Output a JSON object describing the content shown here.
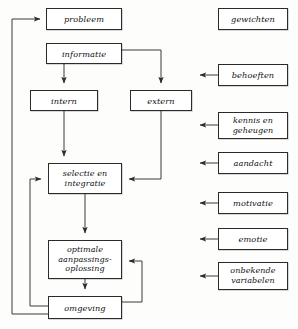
{
  "diagram": {
    "language": "nl",
    "style": {
      "box_border_color": "#2b2b2b",
      "box_fill_color": "#ffffff",
      "line_color": "#3a3a3a",
      "text_color": "#111111",
      "background_color": "#fdfdfc"
    },
    "main_flow": [
      {
        "id": "probleem",
        "label": "probleem",
        "x": 46,
        "y": 8,
        "w": 76,
        "h": 22
      },
      {
        "id": "informatie",
        "label": "informatie",
        "x": 46,
        "y": 43,
        "w": 76,
        "h": 21
      },
      {
        "id": "intern",
        "label": "intern",
        "x": 30,
        "y": 90,
        "w": 68,
        "h": 21
      },
      {
        "id": "extern",
        "label": "extern",
        "x": 130,
        "y": 90,
        "w": 62,
        "h": 21
      },
      {
        "id": "selectie",
        "label_line1": "selectie en",
        "label_line2": "integratie",
        "x": 48,
        "y": 163,
        "w": 74,
        "h": 31
      },
      {
        "id": "oplossing",
        "label_line1": "optimale",
        "label_line2": "aanpassings-",
        "label_line3": "oplossing",
        "x": 48,
        "y": 240,
        "w": 74,
        "h": 39
      },
      {
        "id": "omgeving",
        "label": "omgeving",
        "x": 48,
        "y": 296,
        "w": 74,
        "h": 23
      }
    ],
    "side_factors": [
      {
        "id": "gewichten",
        "label": "gewichten",
        "x": 218,
        "y": 8,
        "w": 70,
        "h": 22,
        "has_arrow": false
      },
      {
        "id": "behoeften",
        "label": "behoeften",
        "x": 218,
        "y": 64,
        "w": 70,
        "h": 22,
        "has_arrow": true
      },
      {
        "id": "kennis-en-geheugen",
        "label_line1": "kennis en",
        "label_line2": "geheugen",
        "x": 218,
        "y": 112,
        "w": 70,
        "h": 27,
        "has_arrow": true
      },
      {
        "id": "aandacht",
        "label": "aandacht",
        "x": 218,
        "y": 152,
        "w": 70,
        "h": 22,
        "has_arrow": true
      },
      {
        "id": "motivatie",
        "label": "motivatie",
        "x": 218,
        "y": 192,
        "w": 70,
        "h": 22,
        "has_arrow": true
      },
      {
        "id": "emotie",
        "label": "emotie",
        "x": 218,
        "y": 228,
        "w": 70,
        "h": 22,
        "has_arrow": true
      },
      {
        "id": "onbekende-variabelen",
        "label_line1": "onbekende",
        "label_line2": "variabelen",
        "x": 218,
        "y": 262,
        "w": 70,
        "h": 28,
        "has_arrow": true
      }
    ],
    "connections": [
      {
        "from": "feedback-outer",
        "to": "probleem",
        "type": "feedback-loop-left-outer"
      },
      {
        "from": "probleem",
        "to": "informatie",
        "type": "adjacent"
      },
      {
        "from": "informatie",
        "to": "intern",
        "type": "down"
      },
      {
        "from": "informatie",
        "to": "extern",
        "type": "right-then-down"
      },
      {
        "from": "intern",
        "to": "selectie",
        "type": "down"
      },
      {
        "from": "extern",
        "to": "selectie",
        "type": "down-then-left"
      },
      {
        "from": "selectie",
        "to": "oplossing",
        "type": "down"
      },
      {
        "from": "oplossing",
        "to": "omgeving",
        "type": "down"
      },
      {
        "from": "omgeving",
        "to": "oplossing",
        "type": "right-loop-up"
      },
      {
        "from": "omgeving",
        "to": "selectie",
        "type": "left-loop-up-inner"
      },
      {
        "from": "omgeving",
        "to": "probleem",
        "type": "left-loop-up-outer"
      }
    ]
  }
}
